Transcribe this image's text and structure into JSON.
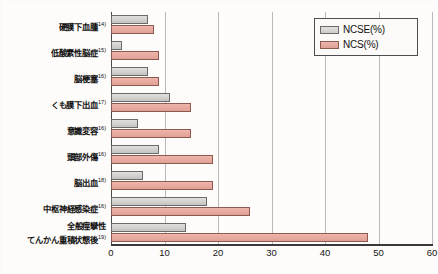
{
  "chart_data": {
    "type": "bar",
    "orientation": "horizontal",
    "title": "",
    "xlabel": "",
    "ylabel": "",
    "xlim": [
      0,
      60
    ],
    "xticks": [
      0,
      10,
      20,
      30,
      40,
      50,
      60
    ],
    "grid": "vertical",
    "legend_position": "top-right",
    "categories": [
      "硬膜下血腫",
      "低酸素性脳症",
      "脳梗塞",
      "くも膜下出血",
      "意識変容",
      "頭部外傷",
      "脳出血",
      "中枢神経感染症",
      "全般痙攣性\nてんかん重積状態後"
    ],
    "category_refs": [
      "14)",
      "15)",
      "16)",
      "17)",
      "16)",
      "16)",
      "18)",
      "16)",
      "19)"
    ],
    "series": [
      {
        "name": "NCSE(%)",
        "color": "#d5d3cf",
        "values": [
          7,
          2,
          7,
          11,
          5,
          9,
          6,
          18,
          14
        ]
      },
      {
        "name": "NCS(%)",
        "color": "#e8a99e",
        "values": [
          8,
          9,
          9,
          15,
          15,
          19,
          19,
          26,
          48
        ]
      }
    ]
  },
  "legend": {
    "items": [
      {
        "label": "NCSE(%)",
        "key": "ncse"
      },
      {
        "label": "NCS(%)",
        "key": "ncs"
      }
    ]
  },
  "categories_display": [
    {
      "line1": "硬膜下血腫",
      "line2": "",
      "ref": "14)"
    },
    {
      "line1": "低酸素性脳症",
      "line2": "",
      "ref": "15)"
    },
    {
      "line1": "脳梗塞",
      "line2": "",
      "ref": "16)"
    },
    {
      "line1": "くも膜下出血",
      "line2": "",
      "ref": "17)"
    },
    {
      "line1": "意識変容",
      "line2": "",
      "ref": "16)"
    },
    {
      "line1": "頭部外傷",
      "line2": "",
      "ref": "16)"
    },
    {
      "line1": "脳出血",
      "line2": "",
      "ref": "18)"
    },
    {
      "line1": "中枢神経感染症",
      "line2": "",
      "ref": "16)"
    },
    {
      "line1": "全般痙攣性",
      "line2": "てんかん重積状態後",
      "ref": "19)"
    }
  ],
  "axis": {
    "tick_labels": [
      "0",
      "10",
      "20",
      "30",
      "40",
      "50",
      "60"
    ]
  }
}
